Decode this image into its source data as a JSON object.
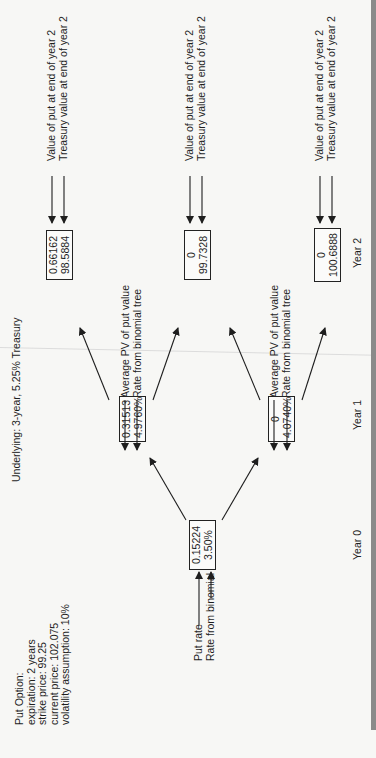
{
  "title": "Underlying: 3-year, 5.25% Treasury",
  "option_info": {
    "heading": "Put Option:",
    "lines": [
      "expiration: 2 years",
      "strike price: 99.25",
      "current price: 102.075",
      "volatility assumption: 10%"
    ]
  },
  "legend": {
    "year0": [
      "Put rate",
      "Rate from binomial tree"
    ],
    "year1": [
      "Average PV of put value",
      "Rate from binomial tree"
    ],
    "year2": [
      "Value of put at end of year 2",
      "Treasury value at end of year 2"
    ]
  },
  "nodes": {
    "y0": {
      "top": "0.15224",
      "bottom": "3.50%"
    },
    "y1_up": {
      "top": "0.31513",
      "bottom": "4.9760%"
    },
    "y1_down": {
      "top": "0",
      "bottom": "4.0740%"
    },
    "y2_up": {
      "top": "0.66162",
      "bottom": "98.5884"
    },
    "y2_mid": {
      "top": "0",
      "bottom": "99.7328"
    },
    "y2_down": {
      "top": "0",
      "bottom": "100.6888"
    }
  },
  "year_labels": [
    "Year 0",
    "Year 1",
    "Year 2"
  ],
  "colors": {
    "background": "#f7f7f5",
    "ink": "#1e1e1e",
    "edge_bar": "#8a8a8a"
  }
}
